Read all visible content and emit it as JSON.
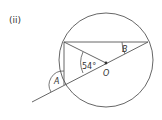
{
  "figure": {
    "part_label": "(ii)",
    "center_label": "O",
    "angle_labels": {
      "given": "54°",
      "a": "A",
      "b": "B"
    },
    "colors": {
      "stroke": "#555555",
      "text": "#333333",
      "background": "#ffffff"
    }
  }
}
